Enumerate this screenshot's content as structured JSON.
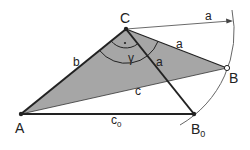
{
  "diagram": {
    "points": {
      "A": {
        "label": "A",
        "x": 21,
        "y": 114
      },
      "B": {
        "label": "B",
        "x": 227,
        "y": 68
      },
      "C": {
        "label": "C",
        "x": 126,
        "y": 29
      },
      "B0": {
        "label": "B",
        "sub": "0",
        "x": 194,
        "y": 114
      }
    },
    "labels": {
      "side_b": "b",
      "side_c": "c",
      "side_c0": "c",
      "side_c0_sub": "0",
      "side_a_CB": "a",
      "side_a_CB0": "a",
      "radius_a": "a",
      "angle_gamma": "γ",
      "right_angle_dot": "·"
    },
    "colors": {
      "fill": "#a6a6a6",
      "stroke": "#222222",
      "arc": "#555555",
      "background": "#ffffff"
    }
  }
}
